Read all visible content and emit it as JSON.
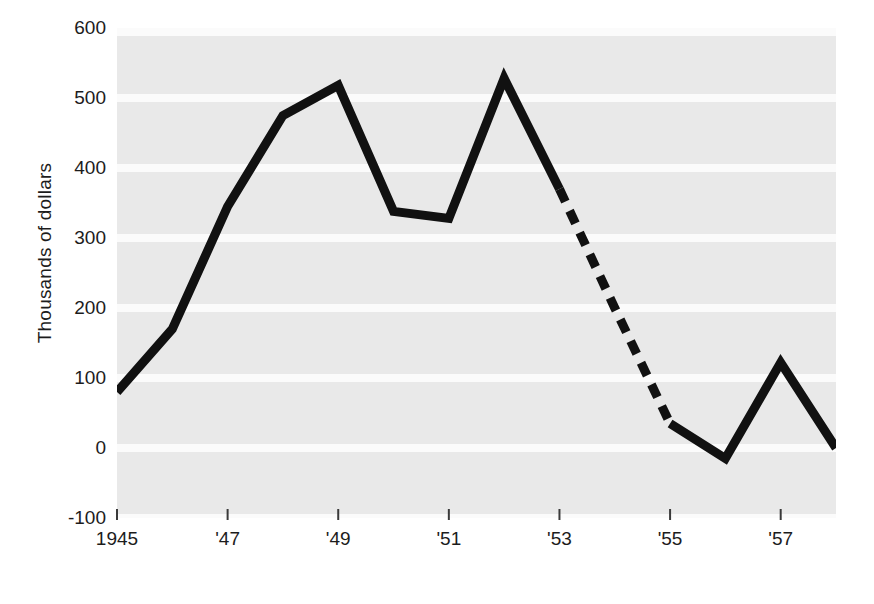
{
  "chart_data": {
    "type": "line",
    "title": "",
    "xlabel": "",
    "ylabel": "Thousands of dollars",
    "x": [
      1945,
      1946,
      1947,
      1948,
      1949,
      1950,
      1951,
      1952,
      1953,
      1954,
      1955,
      1956,
      1957,
      1958
    ],
    "values": [
      80,
      170,
      345,
      475,
      518,
      338,
      328,
      528,
      370,
      200,
      35,
      -15,
      122,
      0
    ],
    "xlim": [
      1945,
      1958
    ],
    "ylim": [
      -100,
      600
    ],
    "ytick_values": [
      600,
      500,
      400,
      300,
      200,
      100,
      0,
      -100
    ],
    "ytick_labels": [
      "600",
      "500",
      "400",
      "300",
      "200",
      "100",
      "0",
      "-100"
    ],
    "xtick_values": [
      1945,
      1947,
      1949,
      1951,
      1953,
      1955,
      1957
    ],
    "xtick_labels": [
      "1945",
      "'47",
      "'49",
      "'51",
      "'53",
      "'55",
      "'57"
    ],
    "grid": true,
    "grid_orientation": "horizontal",
    "legend": "none",
    "series": [
      {
        "name": "Actual",
        "style": "solid",
        "x": [
          1945,
          1946,
          1947,
          1948,
          1949,
          1950,
          1951,
          1952,
          1953
        ],
        "values": [
          80,
          170,
          345,
          475,
          518,
          338,
          328,
          528,
          370
        ]
      },
      {
        "name": "Projected",
        "style": "dashed",
        "x": [
          1953,
          1954,
          1955
        ],
        "values": [
          370,
          200,
          35
        ]
      },
      {
        "name": "Actual (resumed)",
        "style": "solid",
        "x": [
          1955,
          1956,
          1957,
          1958
        ],
        "values": [
          35,
          -15,
          122,
          0
        ]
      }
    ],
    "colors": {
      "line": "#111111",
      "plot_background": "#e9e9e9",
      "gridline": "#fbfbfb",
      "text": "#1c1c1c",
      "figure_background": "#ffffff"
    },
    "line_width_px": 9,
    "dash_pattern": "14 10"
  }
}
